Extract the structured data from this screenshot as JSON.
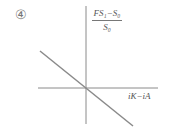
{
  "figure": {
    "panel_number": "④",
    "y_axis_label": {
      "numerator": "FS₁−S₀",
      "denominator": "S₀"
    },
    "x_axis_label": "iK−iA",
    "line": {
      "description": "downward sloping straight line through origin",
      "color": "#8a8a8a"
    },
    "axis_color": "#8a8a8a"
  }
}
